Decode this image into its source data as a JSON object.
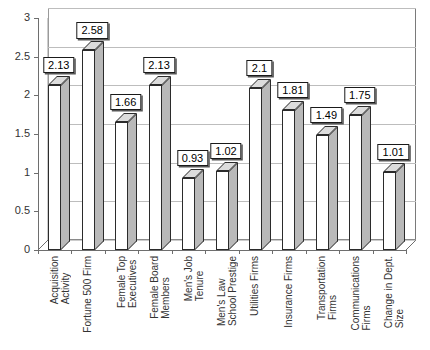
{
  "chart_data": {
    "type": "bar",
    "title": "",
    "subtitle": "",
    "xlabel": "",
    "ylabel": "",
    "ylim": [
      0,
      3
    ],
    "ytick_step": 0.5,
    "yticks": [
      "0",
      "0.5",
      "1",
      "1.5",
      "2",
      "2.5",
      "3"
    ],
    "grid": true,
    "legend": null,
    "style": "3d-column",
    "categories": [
      "Acquisition\nActivity",
      "Fortune 500 Firm",
      "Female Top\nExecutives",
      "Female Board\nMembers",
      "Men's Job\nTenure",
      "Men's Law\nSchool Prestige",
      "Utilities Firms",
      "Insurance Firms",
      "Transportation\nFirms",
      "Communications\nFirms",
      "Change in Dept.\nSize"
    ],
    "values": [
      2.13,
      2.58,
      1.66,
      2.13,
      0.93,
      1.02,
      2.1,
      1.81,
      1.49,
      1.75,
      1.01
    ],
    "data_labels": [
      "2.13",
      "2.58",
      "1.66",
      "2.13",
      "0.93",
      "1.02",
      "2.1",
      "1.81",
      "1.49",
      "1.75",
      "1.01"
    ],
    "colors": {
      "bar_front": "#ffffff",
      "bar_side": "#b9b9b9",
      "bar_top": "#dcdcdc",
      "bar_outline": "#2b2b2b",
      "gridline": "#bdbdbd",
      "axis": "#6e6e6e",
      "label_border": "#1a1a1a",
      "background": "#ffffff",
      "text": "#333333"
    }
  }
}
